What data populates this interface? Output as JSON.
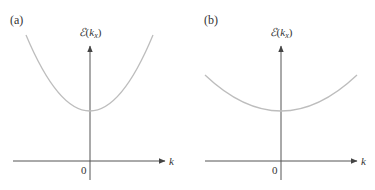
{
  "panels": [
    {
      "id": "a",
      "label": "(a)",
      "y_axis_label_script": "ℰ",
      "y_axis_label_open": "(",
      "y_axis_label_k": "k",
      "y_axis_label_sub": "x",
      "y_axis_label_close": ")",
      "x_axis_label": "k",
      "origin_label": "0",
      "curve_description": "narrow parabola (large curvature)"
    },
    {
      "id": "b",
      "label": "(b)",
      "y_axis_label_script": "ℰ",
      "y_axis_label_open": "(",
      "y_axis_label_k": "k",
      "y_axis_label_sub": "x",
      "y_axis_label_close": ")",
      "x_axis_label": "k",
      "origin_label": "0",
      "curve_description": "wide parabola (small curvature)"
    }
  ],
  "colors": {
    "axis": "#555555",
    "curve": "#bdbdbd",
    "text": "#333333"
  }
}
